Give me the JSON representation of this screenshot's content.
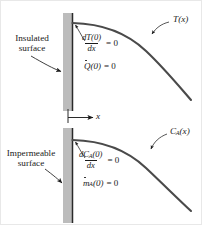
{
  "figure": {
    "type": "boundary-condition-diagram",
    "wall_color": "#bcbcbc",
    "curve_color": "#4a4a4a",
    "panels": [
      {
        "id": "heat",
        "surface_label_line1": "Insulated",
        "surface_label_line2": "surface",
        "curve_label": "T(x)",
        "curve_label_base": "T",
        "curve_label_arg": "(x)",
        "equations": [
          {
            "numerator": "dT(0)",
            "denominator": "dx",
            "rhs": "= 0"
          },
          {
            "symbol": "Q",
            "arg": "(0)",
            "rhs": "= 0"
          }
        ]
      },
      {
        "id": "mass",
        "surface_label_line1": "Impermeable",
        "surface_label_line2": "surface",
        "curve_label": "CA(x)",
        "curve_label_base": "C",
        "curve_label_sub": "A",
        "curve_label_arg": "(x)",
        "equations": [
          {
            "numerator_base": "dC",
            "numerator_sub": "A",
            "numerator_arg": "(0)",
            "denominator": "dx",
            "rhs": "= 0"
          },
          {
            "symbol": "m",
            "sub": "A",
            "arg": "(0)",
            "rhs": "= 0"
          }
        ]
      }
    ],
    "axis": {
      "label": "x"
    }
  }
}
